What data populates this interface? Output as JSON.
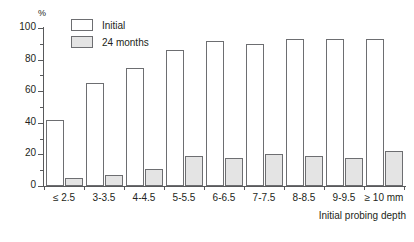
{
  "chart_data": {
    "type": "bar",
    "title": "",
    "xlabel": "Initial probing depth",
    "ylabel": "%",
    "ylim": [
      0,
      100
    ],
    "ytick_labels": [
      "0",
      "20",
      "40",
      "60",
      "80",
      "100"
    ],
    "ytick_values": [
      0,
      20,
      40,
      60,
      80,
      100
    ],
    "yminor_values": [
      10,
      30,
      50,
      70,
      90
    ],
    "grid": false,
    "legend_position": "top-left-inside",
    "categories": [
      "≤ 2.5",
      "3-3.5",
      "4-4.5",
      "5-5.5",
      "6-6.5",
      "7-7.5",
      "8-8.5",
      "9-9.5",
      "≥ 10 mm"
    ],
    "series": [
      {
        "name": "Initial",
        "color": "#ffffff",
        "border": "#6d6e71",
        "values": [
          42,
          65,
          75,
          86,
          92,
          90,
          93,
          93,
          93
        ]
      },
      {
        "name": "24 months",
        "color": "#e4e4e4",
        "border": "#6d6e71",
        "values": [
          5,
          7,
          11,
          19,
          18,
          20,
          19,
          18,
          22
        ]
      }
    ]
  },
  "legend": {
    "items": [
      {
        "label": "Initial"
      },
      {
        "label": "24 months"
      }
    ]
  },
  "axis": {
    "y_unit": "%",
    "x_title": "Initial probing depth"
  }
}
